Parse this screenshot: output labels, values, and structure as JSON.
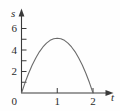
{
  "figure": {
    "background_color": "#fefefe",
    "axis_color": "#3a3a3a",
    "curve_color": "#6b6b6b"
  },
  "chart_data": {
    "type": "line",
    "title": "",
    "subtitle": "",
    "xlabel": "t",
    "ylabel": "s",
    "xlim": [
      0,
      2.45
    ],
    "ylim": [
      0,
      7.2
    ],
    "grid": false,
    "legend": null,
    "x_ticks": [
      0,
      1,
      2
    ],
    "x_tick_labels": [
      "0",
      "1",
      "2"
    ],
    "y_ticks": [
      0,
      1,
      2,
      3,
      4,
      5,
      6
    ],
    "y_tick_labels": [
      "0",
      "",
      "2",
      "",
      "4",
      "",
      "6"
    ],
    "y_labeled_ticks": [
      0,
      2,
      4,
      6
    ],
    "annotations": [],
    "series": [
      {
        "name": "s(t)",
        "equation": "s = 5.1 t (2 - t)",
        "peak_x": 1,
        "peak_y": 5.1,
        "roots": [
          0,
          2
        ],
        "x": [
          0,
          0.1,
          0.2,
          0.3,
          0.4,
          0.5,
          0.6,
          0.7,
          0.8,
          0.9,
          1.0,
          1.1,
          1.2,
          1.3,
          1.4,
          1.5,
          1.6,
          1.7,
          1.8,
          1.9,
          2.0
        ],
        "values": [
          0,
          0.97,
          1.84,
          2.6,
          3.26,
          3.83,
          4.28,
          4.64,
          4.9,
          5.05,
          5.1,
          5.05,
          4.9,
          4.64,
          4.28,
          3.83,
          3.26,
          2.6,
          1.84,
          0.97,
          0
        ]
      }
    ]
  },
  "labels": {
    "x0": "0",
    "x1": "1",
    "x2": "2",
    "y0": "0",
    "y2": "2",
    "y4": "4",
    "y6": "6",
    "x_axis_title": "t",
    "y_axis_title": "s"
  }
}
